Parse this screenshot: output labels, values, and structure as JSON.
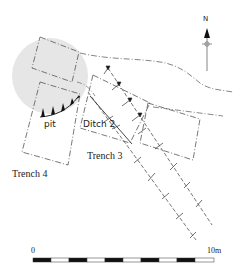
{
  "diagram": {
    "type": "archaeological site plan",
    "labels": {
      "pit": "pit",
      "ditch": "Ditch 2",
      "trench3": "Trench 3",
      "trench4": "Trench 4"
    },
    "north_arrow": {
      "label": "N"
    },
    "scale_bar": {
      "start_label": "0",
      "end_label": "10m",
      "segments": 10
    },
    "colors": {
      "line": "#555555",
      "pit_fill": "#e6e6e6",
      "hachure": "#111111",
      "text": "#222222"
    }
  }
}
